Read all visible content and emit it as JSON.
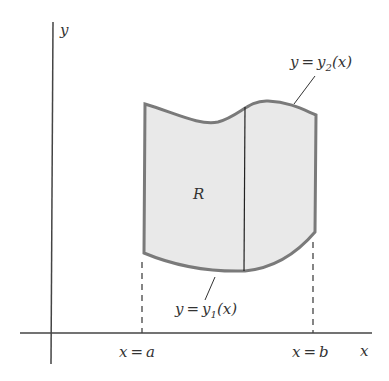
{
  "diagram": {
    "type": "region-between-curves",
    "axes": {
      "x_label": "x",
      "y_label": "y"
    },
    "region_label": "R",
    "upper_curve": {
      "lhs": "y",
      "eq": "=",
      "fn": "y",
      "sub": "2",
      "arg": "(x)"
    },
    "lower_curve": {
      "lhs": "y",
      "eq": "=",
      "fn": "y",
      "sub": "1",
      "arg": "(x)"
    },
    "left_bound": {
      "lhs": "x",
      "eq": "=",
      "rhs": "a"
    },
    "right_bound": {
      "lhs": "x",
      "eq": "=",
      "rhs": "b"
    },
    "colors": {
      "fill": "#e9e9e9",
      "boundary": "#7a7a7a",
      "axis": "#444444"
    }
  }
}
